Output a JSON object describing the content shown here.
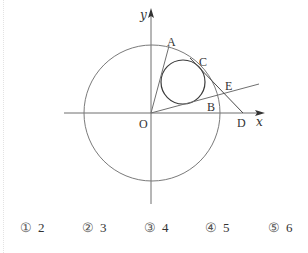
{
  "figure": {
    "axis_labels": {
      "x": "x",
      "y": "y"
    },
    "point_labels": {
      "O": "O",
      "A": "A",
      "B": "B",
      "C": "C",
      "D": "D",
      "E": "E"
    },
    "colors": {
      "stroke": "#6f6f6f",
      "text": "#333333",
      "small_circle": "#3a3a3a"
    }
  },
  "options": [
    {
      "marker": "①",
      "value": "2"
    },
    {
      "marker": "②",
      "value": "3"
    },
    {
      "marker": "③",
      "value": "4"
    },
    {
      "marker": "④",
      "value": "5"
    },
    {
      "marker": "⑤",
      "value": "6"
    }
  ]
}
